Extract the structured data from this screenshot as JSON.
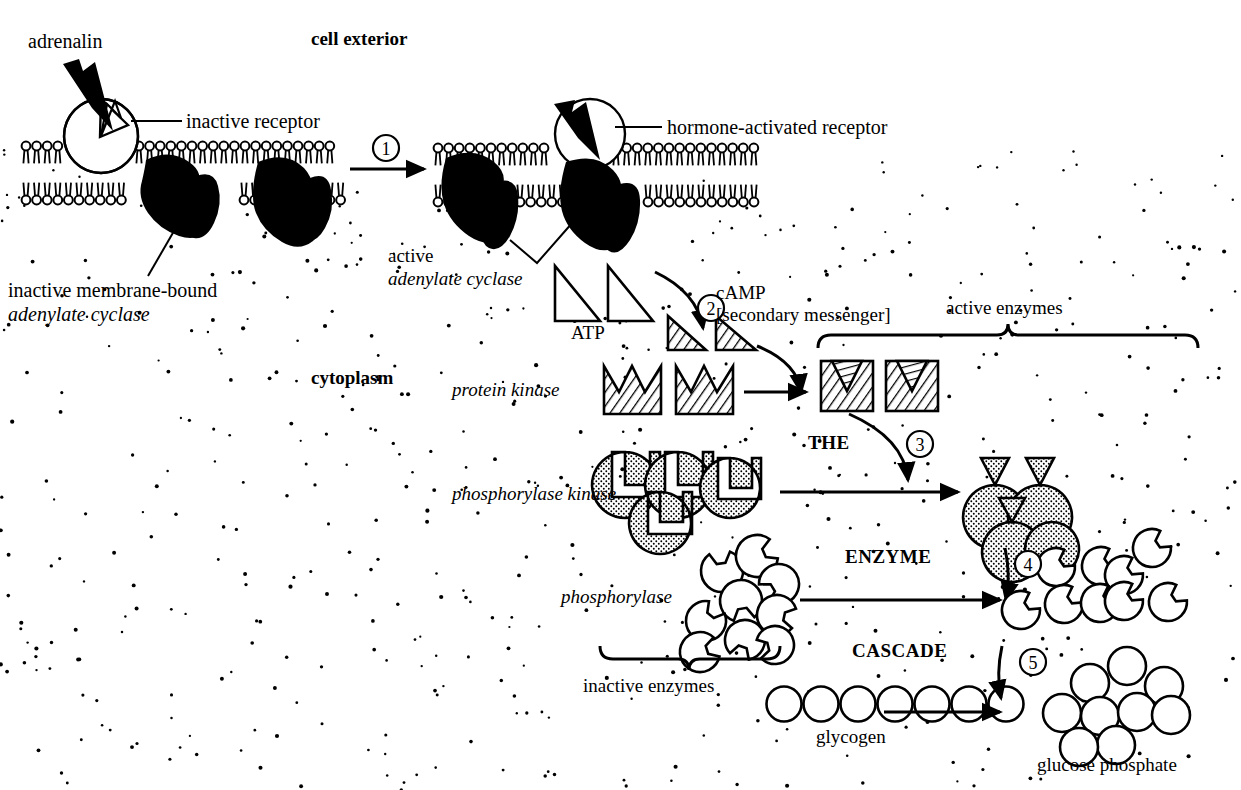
{
  "diagram": {
    "type": "biological-pathway-diagram",
    "background": "#ffffff",
    "ink": "#000000",
    "stipple": "cytoplasm-dot-texture"
  },
  "region_labels": {
    "cell_exterior": "cell exterior",
    "cytoplasm": "cytoplasm"
  },
  "labels": {
    "adrenalin": "adrenalin",
    "inactive_receptor": "inactive receptor",
    "hormone_activated_receptor": "hormone-activated receptor",
    "inactive_membrane_bound": "inactive membrane-bound",
    "adenylate_cyclase_1": "adenylate cyclase",
    "active": "active",
    "adenylate_cyclase_2": "adenylate cyclase",
    "atp": "ATP",
    "camp": "cAMP",
    "camp_sub": "[secondary messenger]",
    "protein_kinase": "protein kinase",
    "phosphorylase_kinase": "phosphorylase kinase",
    "phosphorylase": "phosphorylase",
    "active_enzymes": "active enzymes",
    "inactive_enzymes": "inactive enzymes",
    "glycogen": "glycogen",
    "glucose_phosphate": "glucose phosphate"
  },
  "cascade_heading": {
    "word1": "THE",
    "word2": "ENZYME",
    "word3": "CASCADE"
  },
  "steps": [
    {
      "number": "1",
      "meaning": "hormone binds receptor, activating adenylate cyclase"
    },
    {
      "number": "2",
      "meaning": "ATP converted to cAMP"
    },
    {
      "number": "3",
      "meaning": "cAMP activates protein kinase which activates phosphorylase kinase"
    },
    {
      "number": "4",
      "meaning": "phosphorylase kinase activates phosphorylase"
    },
    {
      "number": "5",
      "meaning": "phosphorylase breaks glycogen into glucose phosphate"
    }
  ],
  "molecules": {
    "atp_count": 2,
    "camp_count": 2,
    "protein_kinase_inactive_count": 2,
    "protein_kinase_active_count": 2,
    "phosphorylase_kinase_subunits": 4,
    "phosphorylase_inactive_count": 9,
    "phosphorylase_active_count": 9,
    "glycogen_units": 7,
    "glucose_phosphate_units": 9
  }
}
